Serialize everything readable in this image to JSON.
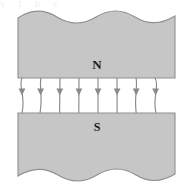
{
  "figure": {
    "kind": "physics-diagram",
    "width": 188,
    "height": 193,
    "background_color": "#ffffff",
    "bleed_text": "y f p c",
    "poles": [
      {
        "id": "north",
        "label": "N",
        "position": "top",
        "fill_color": "#c6c6c6",
        "stroke_color": "#8f8f8f",
        "x": 18,
        "y": 11,
        "width": 157,
        "height": 67,
        "outer_edge": "wavy",
        "label_x": 97,
        "label_y": 66
      },
      {
        "id": "south",
        "label": "S",
        "position": "bottom",
        "fill_color": "#c6c6c6",
        "stroke_color": "#8f8f8f",
        "x": 18,
        "y": 113,
        "width": 157,
        "height": 69,
        "outer_edge": "wavy",
        "label_x": 97,
        "label_y": 127
      }
    ],
    "field": {
      "name": "magnetic-field-lines",
      "direction": "north-to-south",
      "line_count": 8,
      "line_color": "#8a8a8a",
      "arrowhead_color": "#8a8a8a",
      "arrowhead_y": 91,
      "gap_top": 78,
      "gap_bottom": 113,
      "line_x_positions": [
        22,
        41,
        60,
        79,
        98,
        117,
        136,
        155
      ],
      "fringing": "outermost lines bow outward"
    }
  }
}
